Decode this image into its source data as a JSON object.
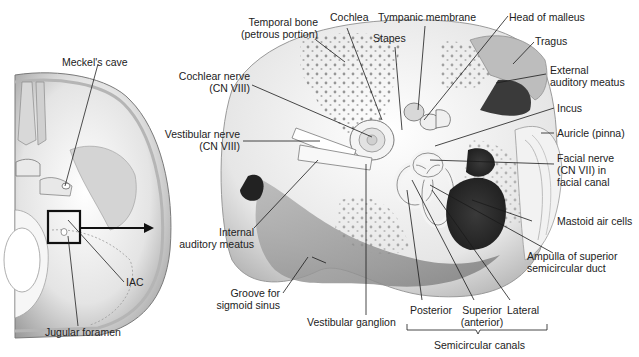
{
  "figure": {
    "left_panel": {
      "title": "Skull base (axial view)",
      "labels": {
        "meckels_cave": "Meckel's cave",
        "iac": "IAC",
        "jugular_foramen": "Jugular foramen"
      }
    },
    "right_panel": {
      "labels": {
        "temporal_bone_1": "Temporal bone",
        "temporal_bone_2": "(petrous portion)",
        "cochlea": "Cochlea",
        "tympanic_membrane": "Tympanic membrane",
        "head_of_malleus": "Head of malleus",
        "stapes": "Stapes",
        "tragus": "Tragus",
        "external_auditory_meatus_1": "External",
        "external_auditory_meatus_2": "auditory meatus",
        "cochlear_nerve_1": "Cochlear nerve",
        "cochlear_nerve_2": "(CN VIII)",
        "vestibular_nerve_1": "Vestibular nerve",
        "vestibular_nerve_2": "(CN VIII)",
        "incus": "Incus",
        "auricle": "Auricle (pinna)",
        "facial_nerve_1": "Facial nerve",
        "facial_nerve_2": "(CN VII) in",
        "facial_nerve_3": "facial canal",
        "mastoid_air_cells": "Mastoid air cells",
        "internal_auditory_meatus_1": "Internal",
        "internal_auditory_meatus_2": "auditory meatus",
        "ampulla_1": "Ampulla of superior",
        "ampulla_2": "semicircular duct",
        "groove_sigmoid_1": "Groove for",
        "groove_sigmoid_2": "sigmoid sinus",
        "vestibular_ganglion": "Vestibular ganglion",
        "posterior": "Posterior",
        "superior_1": "Superior",
        "superior_2": "(anterior)",
        "lateral": "Lateral",
        "semicircular_canals": "Semicircular canals"
      }
    },
    "colors": {
      "background": "#ffffff",
      "bone_light": "#f0f0f0",
      "bone_mid": "#c8c8c8",
      "shadow": "#8a8a8a",
      "dark": "#2a2a2a",
      "line": "#1a1a1a"
    }
  }
}
